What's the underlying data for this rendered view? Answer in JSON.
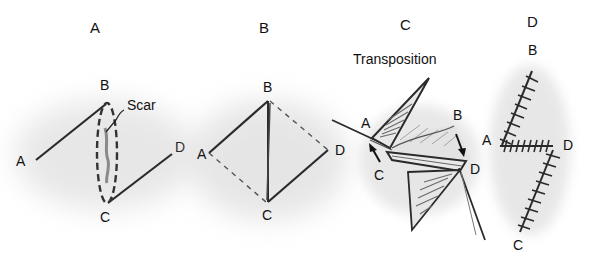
{
  "figure": {
    "panels": [
      {
        "id": "A",
        "title": "A",
        "points": {
          "A": "A",
          "B": "B",
          "C": "C",
          "D": "D"
        },
        "annotation": "Scar"
      },
      {
        "id": "B",
        "title": "B",
        "points": {
          "A": "A",
          "B": "B",
          "C": "C",
          "D": "D"
        }
      },
      {
        "id": "C",
        "title": "C",
        "caption": "Transposition",
        "points": {
          "A": "A",
          "B": "B",
          "C": "C",
          "D": "D",
          "D2": "D"
        }
      },
      {
        "id": "D",
        "title": "D",
        "points": {
          "A": "A",
          "B": "B",
          "C": "C",
          "D": "D"
        }
      }
    ],
    "colors": {
      "line": "#2a2a2a",
      "shadow": "#cfcfcf",
      "dash": "#555555",
      "hatch": "#6a6a6a"
    }
  }
}
